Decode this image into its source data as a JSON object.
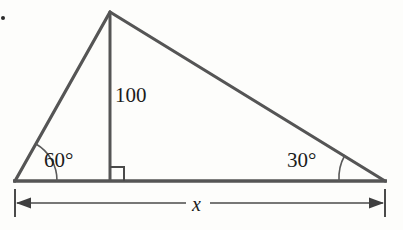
{
  "figure": {
    "kind": "geometry-diagram",
    "shape": "triangle-with-altitude",
    "background_color": "#fdfdfb",
    "stroke_color": "#555555",
    "thin_stroke_color": "#4a4a4a",
    "text_color": "#1c1c1c",
    "labels": {
      "angle_left": "60°",
      "angle_right": "30°",
      "height": "100",
      "base": "x"
    },
    "geometry": {
      "left_vertex": [
        15,
        181
      ],
      "right_vertex": [
        385,
        181
      ],
      "apex": [
        110,
        12
      ],
      "altitude_foot": [
        110,
        181
      ],
      "right_angle_marker_size": 14,
      "arc_left_radius": 42,
      "arc_right_radius": 46,
      "dimension_line_y": 203,
      "dimension_tick_top": 189,
      "dimension_tick_bottom": 217,
      "dimension_left_x": 15,
      "dimension_right_x": 385,
      "dimension_gap_start": 186,
      "dimension_gap_end": 210
    },
    "bullet_marker": {
      "x": 3,
      "y": 18
    }
  }
}
